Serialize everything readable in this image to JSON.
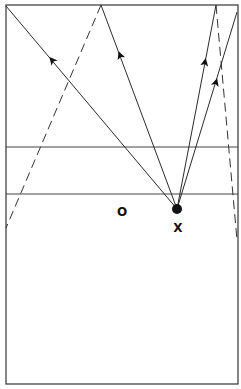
{
  "diagram": {
    "labels": {
      "opponent": "O",
      "player": "X"
    },
    "colors": {
      "line": "#2a2a2a",
      "background": "#ffffff"
    }
  }
}
